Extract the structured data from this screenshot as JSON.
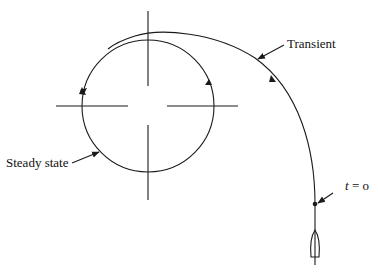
{
  "diagram": {
    "labels": {
      "transient": "Transient",
      "steady_state": "Steady state",
      "t_var": "t",
      "t_eq": " = o"
    },
    "colors": {
      "stroke": "#1a1a1a",
      "background": "#ffffff"
    }
  }
}
